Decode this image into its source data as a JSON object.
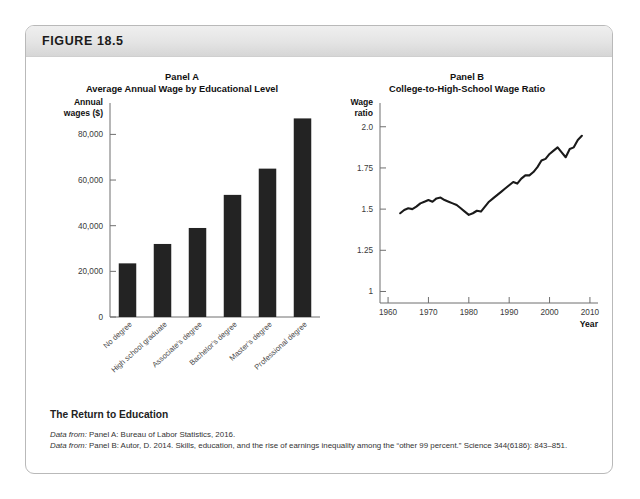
{
  "figure": {
    "number_label": "FIGURE 18.5",
    "caption_title": "The Return to Education",
    "source_a_prefix": "Data from:",
    "source_a_text": " Panel A: Bureau of Labor Statistics, 2016.",
    "source_b_prefix": "Data from:",
    "source_b_text": " Panel B: Autor, D. 2014. Skills, education, and the rise of earnings inequality among the “other 99 percent.” Science 344(6186): 843–851."
  },
  "chart_data": [
    {
      "type": "bar",
      "panel": "Panel A",
      "title": "Panel A",
      "subtitle": "Average Annual Wage by Educational Level",
      "ylabel_line1": "Annual",
      "ylabel_line2": "wages ($)",
      "xlabel": "",
      "categories": [
        "No degree",
        "High school graduate",
        "Associate's degree",
        "Bachelor's degree",
        "Master's degree",
        "Professional degree"
      ],
      "values": [
        23500,
        32000,
        39000,
        53500,
        65000,
        87000
      ],
      "ylim": [
        0,
        92000
      ],
      "yticks": [
        0,
        20000,
        40000,
        60000,
        80000
      ],
      "ytick_labels": [
        "0",
        "20,000",
        "40,000",
        "60,000",
        "80,000"
      ],
      "grid": false,
      "bar_color": "#232323"
    },
    {
      "type": "line",
      "panel": "Panel B",
      "title": "Panel B",
      "subtitle": "College-to-High-School Wage Ratio",
      "ylabel_line1": "Wage",
      "ylabel_line2": "ratio",
      "xlabel": "Year",
      "ylim": [
        0.93,
        2.12
      ],
      "yticks": [
        1,
        1.25,
        1.5,
        1.75,
        2.0
      ],
      "ytick_labels": [
        "1",
        "1.25",
        "1.5",
        "1.75",
        "2.0"
      ],
      "xlim": [
        1958,
        2012
      ],
      "xticks": [
        1960,
        1970,
        1980,
        1990,
        2000,
        2010
      ],
      "xtick_labels": [
        "1960",
        "1970",
        "1980",
        "1990",
        "2000",
        "2010"
      ],
      "grid": false,
      "line_color": "#1a1a1a",
      "x": [
        1963,
        1964,
        1965,
        1966,
        1967,
        1968,
        1969,
        1970,
        1971,
        1972,
        1973,
        1974,
        1975,
        1976,
        1977,
        1978,
        1979,
        1980,
        1981,
        1982,
        1983,
        1984,
        1985,
        1986,
        1987,
        1988,
        1989,
        1990,
        1991,
        1992,
        1993,
        1994,
        1995,
        1996,
        1997,
        1998,
        1999,
        2000,
        2001,
        2002,
        2003,
        2004,
        2005,
        2006,
        2007,
        2008
      ],
      "values": [
        1.475,
        1.495,
        1.505,
        1.5,
        1.515,
        1.535,
        1.545,
        1.555,
        1.545,
        1.565,
        1.57,
        1.555,
        1.545,
        1.535,
        1.525,
        1.505,
        1.485,
        1.465,
        1.475,
        1.49,
        1.485,
        1.515,
        1.545,
        1.565,
        1.585,
        1.605,
        1.625,
        1.645,
        1.665,
        1.655,
        1.685,
        1.705,
        1.705,
        1.725,
        1.755,
        1.795,
        1.805,
        1.835,
        1.855,
        1.875,
        1.845,
        1.815,
        1.865,
        1.875,
        1.92,
        1.945
      ]
    }
  ]
}
